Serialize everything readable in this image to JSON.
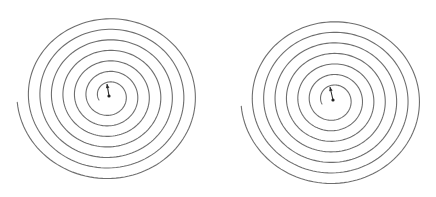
{
  "figure": {
    "width": 436,
    "height": 197,
    "background": "#ffffff",
    "stroke_color": "#6e6e6e",
    "marker_color": "#222222"
  },
  "spirals": [
    {
      "id": "left",
      "center": [
        109,
        96
      ],
      "inner_start": [
        99,
        100
      ],
      "outer_end": [
        14,
        103
      ],
      "radius_x_outer": 92,
      "radius_y_outer": 85,
      "turns": 7.5,
      "direction": "clockwise",
      "arrow_tip": [
        107,
        84
      ]
    },
    {
      "id": "right",
      "center": [
        333,
        100
      ],
      "inner_start": [
        322,
        104
      ],
      "outer_end": [
        236,
        107
      ],
      "radius_x_outer": 92,
      "radius_y_outer": 86,
      "turns": 7.5,
      "direction": "clockwise",
      "arrow_tip": [
        330,
        87
      ]
    }
  ]
}
